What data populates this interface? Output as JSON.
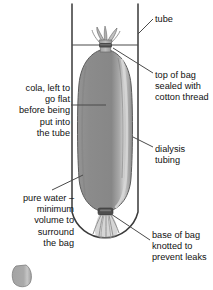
{
  "figure": {
    "background_color": "#ffffff"
  },
  "colors": {
    "outline": "#3a3a3a",
    "bag_fill": "#8d8d8d",
    "bag_fill_dark": "#787878",
    "bag_highlight": "#c9c9c9",
    "knot_dark": "#4a4a4a",
    "thread": "#9a9a9a",
    "text": "#111111",
    "leader_line": "#4a4a4a",
    "stray_blob": "#a6a6a6"
  },
  "labels": {
    "tube": {
      "text": "tube",
      "align": "left"
    },
    "top_of_bag": {
      "text": "top of bag\nsealed with\ncotton thread",
      "align": "left"
    },
    "cola": {
      "text": "cola, left to\ngo flat\nbefore being\nput into\nthe tube",
      "align": "right"
    },
    "dialysis_tubing": {
      "text": "dialysis\ntubing",
      "align": "left"
    },
    "pure_water": {
      "text": "pure water –\nminimum\nvolume to\nsurround\nthe bag",
      "align": "right"
    },
    "base_of_bag": {
      "text": "base of bag\nknotted to\nprevent leaks",
      "align": "left"
    }
  },
  "parts": [
    {
      "name": "tube",
      "description": "open glass boiling tube with rounded base"
    },
    {
      "name": "water-surface-line",
      "description": "horizontal water level line near top of tube"
    },
    {
      "name": "dialysis-bag",
      "description": "grey sausage-shaped bag of cola inside the tube"
    },
    {
      "name": "top-knot",
      "description": "bag neck gathered and tied with cotton thread"
    },
    {
      "name": "bottom-knot",
      "description": "knotted base of the bag with frayed thread ends"
    },
    {
      "name": "stray-blob",
      "description": "small grey rounded shape at lower left of image"
    }
  ]
}
